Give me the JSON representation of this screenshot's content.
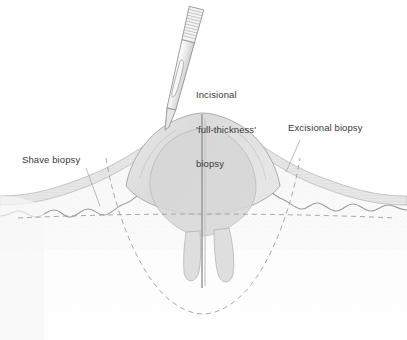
{
  "figure": {
    "kind": "medical-illustration",
    "background_color": "#ffffff",
    "text_color": "#3a3a3a"
  },
  "labels": {
    "incisional": {
      "line1": "Incisional",
      "line2": "'full-thickness'",
      "line3": "biopsy"
    },
    "excisional": {
      "text": "Excisional biopsy"
    },
    "shave": {
      "text": "Shave biopsy"
    }
  },
  "instrument": {
    "name": "scalpel",
    "parts": [
      "ribbed-handle",
      "blade-with-fuller-slot",
      "cutting-tip"
    ],
    "blade_fill": "#f2f2f2",
    "outline_color": "#8e8e8e"
  },
  "anatomy": {
    "layers": [
      {
        "name": "epidermis",
        "fill": "#e2e2e2",
        "boundary": "wavy-rete-ridges"
      },
      {
        "name": "dermis",
        "fill": "#f6f6f6",
        "texture": "fine-stipple"
      },
      {
        "name": "lesion-dome",
        "fill": "#dcdcdc"
      },
      {
        "name": "tumor-root-projections",
        "count": 2
      }
    ]
  },
  "markings": {
    "shave_plane": {
      "style": "dashed-horizontal",
      "color": "#9a9a9a"
    },
    "excision_margin": {
      "style": "dashed-u-curve",
      "color": "#9a9a9a"
    },
    "incision_line": {
      "style": "solid-vertical",
      "color": "#9a9a9a"
    }
  },
  "palette": {
    "outline": "#9a9a9a",
    "dash": "#9a9a9a",
    "skin_light": "#f4f4f4",
    "skin_mid": "#e4e4e4",
    "lesion": "#dcdcdc"
  }
}
